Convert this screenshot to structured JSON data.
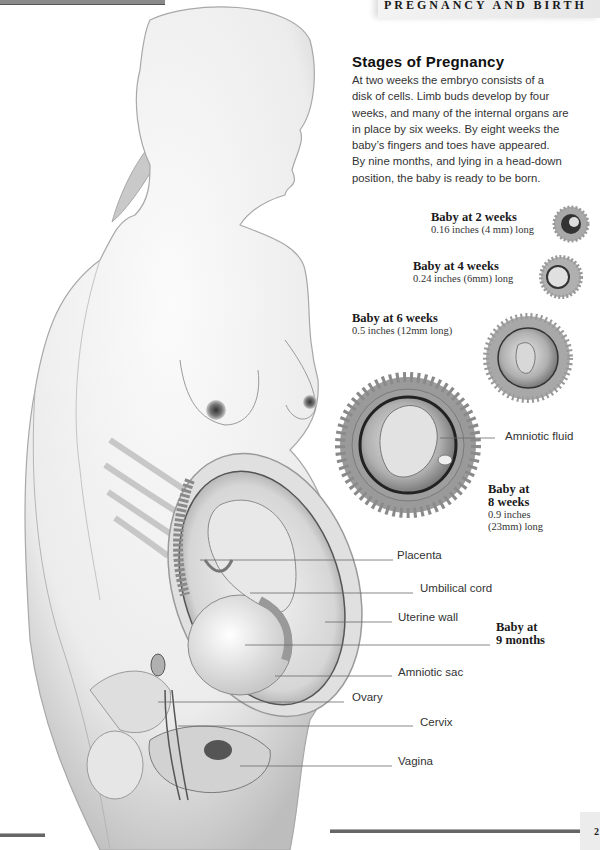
{
  "header": {
    "section_title": "PREGNANCY AND BIRTH"
  },
  "intro": {
    "title": "Stages of Pregnancy",
    "lines": [
      "At two weeks the embryo consists of a",
      "disk of cells. Limb buds develop by four",
      "weeks, and many of the internal organs are",
      "in place by six weeks. By eight weeks the",
      "baby’s fingers and toes have appeared.",
      "By nine months, and lying in a head-down",
      "position, the baby is ready to be born."
    ]
  },
  "stages": [
    {
      "title": "Baby at 2 weeks",
      "size": "0.16 inches (4 mm) long"
    },
    {
      "title": "Baby at 4 weeks",
      "size": "0.24 inches (6mm) long"
    },
    {
      "title": "Baby at 6 weeks",
      "size": "0.5 inches (12mm long)"
    },
    {
      "title_line1": "Baby at",
      "title_line2": "8 weeks",
      "size_line1": "0.9 inches",
      "size_line2": "(23mm) long"
    }
  ],
  "embryo_labels": {
    "amniotic_fluid": "Amniotic fluid"
  },
  "anatomy_labels": {
    "placenta": "Placenta",
    "umbilical_cord": "Umbilical cord",
    "uterine_wall": "Uterine wall",
    "amniotic_sac": "Amniotic sac",
    "ovary": "Ovary",
    "cervix": "Cervix",
    "vagina": "Vagina"
  },
  "nine_months": {
    "line1": "Baby at",
    "line2": "9 months"
  },
  "page_number": "2",
  "colors": {
    "ink": "#1a1a1a",
    "body_text": "#333333",
    "skin": "#f2f2f2",
    "shadow": "#9a9a9a",
    "rule": "#666666"
  }
}
